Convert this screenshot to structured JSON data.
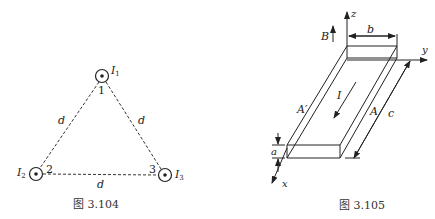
{
  "figure_3_104": {
    "caption": "图 3.104",
    "wires": [
      {
        "current_label": "I",
        "current_sub": "1",
        "vertex_label": "1",
        "cx": 102,
        "cy": 76
      },
      {
        "current_label": "I",
        "current_sub": "2",
        "vertex_label": "2",
        "cx": 36,
        "cy": 174
      },
      {
        "current_label": "I",
        "current_sub": "3",
        "vertex_label": "3",
        "cx": 165,
        "cy": 175
      }
    ],
    "side_labels": [
      "d",
      "d",
      "d"
    ],
    "current_direction": "out-of-page"
  },
  "figure_3_105": {
    "caption": "图 3.105",
    "axes": {
      "x": "x",
      "y": "y",
      "z": "z"
    },
    "field_label": "B",
    "current_label": "I",
    "dimension_labels": {
      "width": "b",
      "thickness": "a",
      "length": "c"
    },
    "face_labels": {
      "left": "A′",
      "right": "A"
    }
  }
}
